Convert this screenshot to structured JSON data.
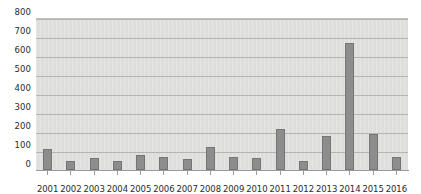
{
  "chart_data": {
    "type": "bar",
    "title": "",
    "subtitle": "",
    "xlabel": "",
    "ylabel": "",
    "categories": [
      "2001",
      "2002",
      "2003",
      "2004",
      "2005",
      "2006",
      "2007",
      "2008",
      "2009",
      "2010",
      "2011",
      "2012",
      "2013",
      "2014",
      "2015",
      "2016"
    ],
    "values": [
      110,
      50,
      65,
      45,
      80,
      70,
      60,
      120,
      70,
      65,
      215,
      50,
      180,
      670,
      190,
      70
    ],
    "series": [
      {
        "name": "",
        "values": [
          110,
          50,
          65,
          45,
          80,
          70,
          60,
          120,
          70,
          65,
          215,
          50,
          180,
          670,
          190,
          70
        ]
      }
    ],
    "ylim": [
      0,
      800
    ],
    "ytick_step": 100,
    "yticks": [
      0,
      100,
      200,
      300,
      400,
      500,
      600,
      700,
      800
    ],
    "ytick_labels": [
      "0",
      "100",
      "200",
      "300",
      "400",
      "500",
      "600",
      "700",
      "800"
    ],
    "grid": true,
    "grid_axis": "y",
    "legend": false,
    "legend_position": "none",
    "annotations": [],
    "colors": {
      "bar_fill": "#8d8d8d",
      "bar_border": "#757575",
      "plot_background": "#dededd",
      "gridline": "#b4b4b4",
      "axis_line": "#9a9a9a",
      "tick_label": "#2b2b2b",
      "figure_background": "#ffffff"
    }
  }
}
